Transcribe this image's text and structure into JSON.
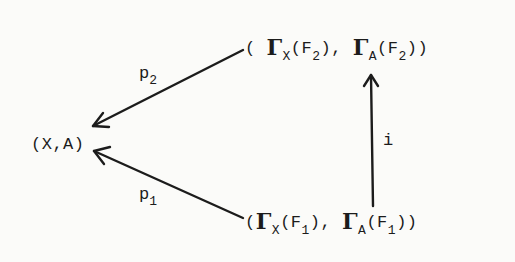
{
  "diagram": {
    "type": "commutative-diagram",
    "nodes": {
      "base": {
        "text": "(X,A)"
      },
      "top": {
        "open": "( ",
        "gamma1": "Γ",
        "sub1": "X",
        "arg1": "(F",
        "argsub1": "2",
        "close1": "),  ",
        "gamma2": "Γ",
        "sub2": "A",
        "arg2": "(F",
        "argsub2": "2",
        "close2": "))"
      },
      "bottom": {
        "open": "(",
        "gamma1": "Γ",
        "sub1": "X",
        "arg1": "(F",
        "argsub1": "1",
        "close1": "),  ",
        "gamma2": "Γ",
        "sub2": "A",
        "arg2": "(F",
        "argsub2": "1",
        "close2": "))"
      }
    },
    "arrows": {
      "p2": {
        "label": "p",
        "label_sub": "2",
        "from": "top",
        "to": "base"
      },
      "p1": {
        "label": "p",
        "label_sub": "1",
        "from": "bottom",
        "to": "base"
      },
      "i": {
        "label": "i",
        "from": "bottom",
        "to": "top"
      }
    },
    "colors": {
      "ink": "#1c1c1c",
      "paper": "#fbfbf9"
    }
  }
}
